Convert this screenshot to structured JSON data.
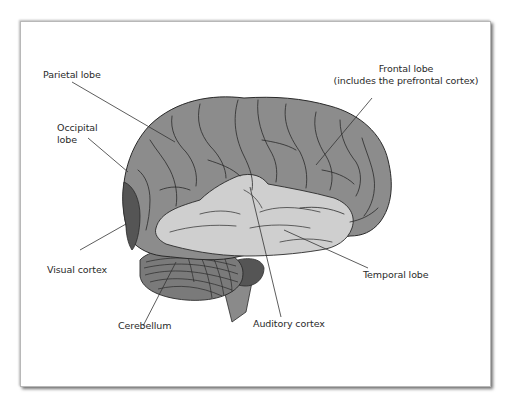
{
  "figure": {
    "colors": {
      "cerebrum": "#8c8c8c",
      "temporal_lobe": "#cfcfcf",
      "visual_cortex": "#555555",
      "cerebellum": "#7a7a7a",
      "brainstem": "#8a8a8a",
      "outline": "#2a2a2a",
      "leader_lines": "#333333",
      "frame_border": "#b8b8b8"
    },
    "labels": {
      "parietal_lobe": "Parietal lobe",
      "frontal_lobe": "Frontal lobe",
      "frontal_lobe_note": "(includes the prefrontal cortex)",
      "occipital_lobe_line1": "Occipital",
      "occipital_lobe_line2": "lobe",
      "visual_cortex": "Visual cortex",
      "temporal_lobe": "Temporal lobe",
      "cerebellum": "Cerebellum",
      "auditory_cortex": "Auditory cortex"
    }
  }
}
